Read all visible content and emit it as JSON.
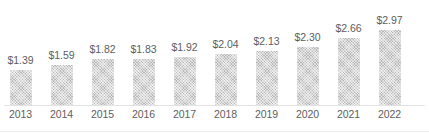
{
  "chart_data": {
    "type": "bar",
    "title": "",
    "subtitle": "",
    "xlabel": "",
    "ylabel": "",
    "grid": false,
    "legend": null,
    "categories": [
      "2013",
      "2014",
      "2015",
      "2016",
      "2017",
      "2018",
      "2019",
      "2020",
      "2021",
      "2022"
    ],
    "values": [
      1.39,
      1.59,
      1.82,
      1.83,
      1.92,
      2.04,
      2.13,
      2.3,
      2.66,
      2.97
    ],
    "data_labels": [
      "$1.39",
      "$1.59",
      "$1.82",
      "$1.83",
      "$1.92",
      "$2.04",
      "$2.13",
      "$2.30",
      "$2.66",
      "$2.97"
    ],
    "ylim": [
      0,
      3.6
    ],
    "bar_color": "#b9b9b9",
    "bar_pattern": "diagonal-crosshatch",
    "axis_color": "#e2e2e2",
    "label_color": "#5d5d5d",
    "currency_prefix": "$"
  }
}
